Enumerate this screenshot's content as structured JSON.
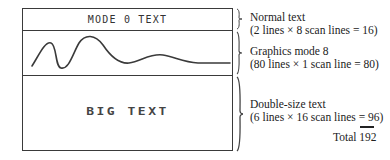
{
  "screen": {
    "regions": [
      {
        "id": "normal-text",
        "content": "MODE 0 TEXT"
      },
      {
        "id": "graphics",
        "content": "waveform-curve"
      },
      {
        "id": "double-size",
        "content": "BIG TEXT"
      }
    ]
  },
  "annotations": [
    {
      "title": "Normal text",
      "detail": "(2 lines × 8 scan lines = 16)"
    },
    {
      "title": "Graphics mode 8",
      "detail": "(80 lines × 1 scan line = 80)"
    },
    {
      "title": "Double-size text",
      "detail": "(6 lines × 16 scan lines = 96)"
    }
  ],
  "total": {
    "label": "Total 192"
  },
  "colors": {
    "line": "#3a3a3a",
    "text": "#222222",
    "background": "#ffffff"
  }
}
